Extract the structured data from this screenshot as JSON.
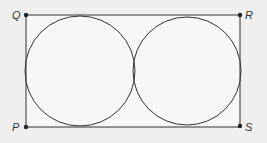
{
  "diagram": {
    "type": "geometry",
    "points": [
      {
        "label": "Q",
        "x": 26,
        "y": 15
      },
      {
        "label": "R",
        "x": 240,
        "y": 15
      },
      {
        "label": "S",
        "x": 240,
        "y": 126
      },
      {
        "label": "P",
        "x": 26,
        "y": 127
      }
    ],
    "circles": [
      {
        "name": "left-circle",
        "cx": 80,
        "cy": 71,
        "r": 55
      },
      {
        "name": "right-circle",
        "cx": 187,
        "cy": 71,
        "r": 54
      }
    ],
    "colors": {
      "stroke": "#333333",
      "background": "#efefef"
    }
  }
}
